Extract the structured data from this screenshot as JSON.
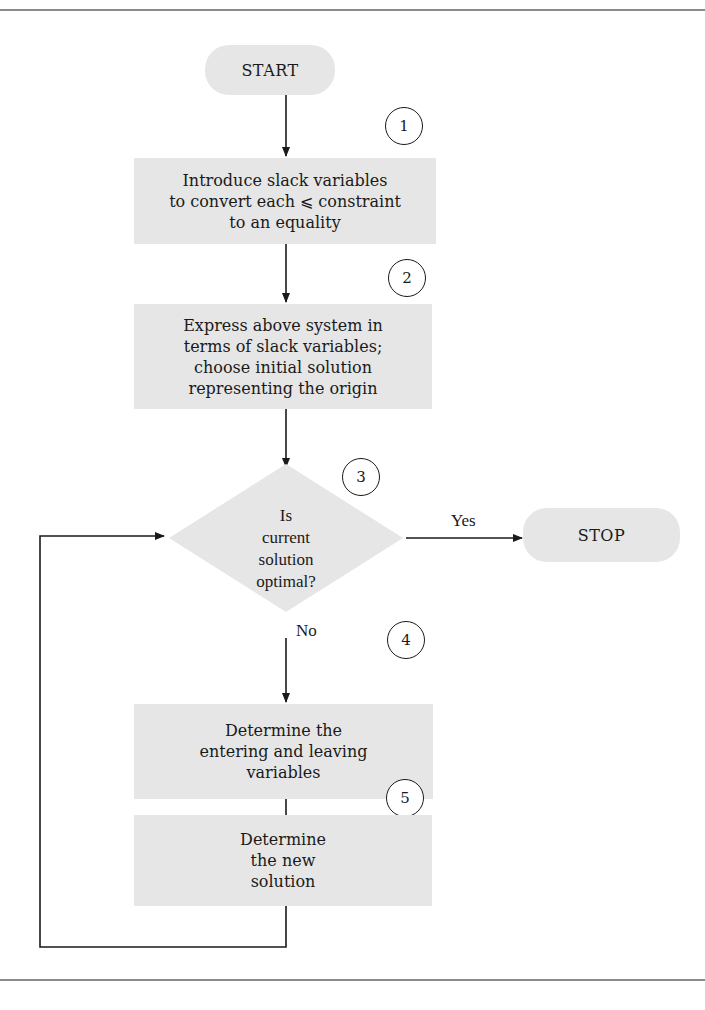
{
  "diagram": {
    "type": "flowchart",
    "fill_color": "#e6e6e6",
    "line_color": "#1a1a1a",
    "rule_color": "#8a8a8a",
    "nodes": {
      "start": {
        "label": "START",
        "shape": "terminal"
      },
      "step1": {
        "step": "1",
        "label": "Introduce slack variables\nto convert each ⩽ constraint\nto an equality",
        "shape": "process"
      },
      "step2": {
        "step": "2",
        "label": "Express above system in\nterms of slack variables;\nchoose initial solution\nrepresenting the origin",
        "shape": "process"
      },
      "step3": {
        "step": "3",
        "label": "Is\ncurrent\nsolution\noptimal?",
        "shape": "decision"
      },
      "stop": {
        "label": "STOP",
        "shape": "terminal"
      },
      "step4": {
        "step": "4",
        "label": "Determine the\nentering and leaving\nvariables",
        "shape": "process"
      },
      "step5": {
        "step": "5",
        "label": "Determine\nthe new\nsolution",
        "shape": "process"
      }
    },
    "edges": [
      {
        "from": "start",
        "to": "step1",
        "label": ""
      },
      {
        "from": "step1",
        "to": "step2",
        "label": ""
      },
      {
        "from": "step2",
        "to": "step3",
        "label": ""
      },
      {
        "from": "step3",
        "to": "stop",
        "label": "Yes"
      },
      {
        "from": "step3",
        "to": "step4",
        "label": "No"
      },
      {
        "from": "step4",
        "to": "step5",
        "label": ""
      },
      {
        "from": "step5",
        "to": "step3",
        "label": ""
      }
    ]
  }
}
